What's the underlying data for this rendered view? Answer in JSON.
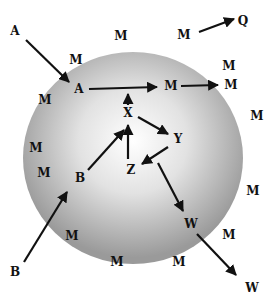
{
  "diagram": {
    "type": "sphere-particle-transfer",
    "colors": {
      "sphere_center": "#ffffff",
      "sphere_edge": "#9a9a9a",
      "ink": "#111111",
      "background": "#ffffff"
    },
    "sphere": {
      "cx": 133,
      "cy": 158,
      "rx": 110,
      "ry": 106
    },
    "labels": [
      {
        "id": "A-outside",
        "text": "A",
        "x": 15,
        "y": 31
      },
      {
        "id": "M-top-1",
        "text": "M",
        "x": 121,
        "y": 36
      },
      {
        "id": "M-top-2",
        "text": "M",
        "x": 184,
        "y": 35
      },
      {
        "id": "Q-outside",
        "text": "Q",
        "x": 243,
        "y": 21
      },
      {
        "id": "M-upper-left",
        "text": "M",
        "x": 76,
        "y": 60
      },
      {
        "id": "A-surface",
        "text": "A",
        "x": 79,
        "y": 89
      },
      {
        "id": "M-inner",
        "text": "M",
        "x": 171,
        "y": 86
      },
      {
        "id": "M-upper-right-1",
        "text": "M",
        "x": 229,
        "y": 66
      },
      {
        "id": "M-upper-right-2",
        "text": "M",
        "x": 231,
        "y": 85
      },
      {
        "id": "M-left-1",
        "text": "M",
        "x": 45,
        "y": 100
      },
      {
        "id": "X",
        "text": "X",
        "x": 128,
        "y": 113
      },
      {
        "id": "M-right-1",
        "text": "M",
        "x": 257,
        "y": 116
      },
      {
        "id": "Y",
        "text": "Y",
        "x": 178,
        "y": 139
      },
      {
        "id": "M-left-2",
        "text": "M",
        "x": 36,
        "y": 148
      },
      {
        "id": "Z",
        "text": "Z",
        "x": 131,
        "y": 170
      },
      {
        "id": "M-left-3",
        "text": "M",
        "x": 44,
        "y": 173
      },
      {
        "id": "B-surface",
        "text": "B",
        "x": 80,
        "y": 178
      },
      {
        "id": "M-right-2",
        "text": "M",
        "x": 253,
        "y": 191
      },
      {
        "id": "M-lower-left",
        "text": "M",
        "x": 72,
        "y": 236
      },
      {
        "id": "W-surface",
        "text": "W",
        "x": 191,
        "y": 224
      },
      {
        "id": "M-lower-right",
        "text": "M",
        "x": 229,
        "y": 235
      },
      {
        "id": "M-bottom-1",
        "text": "M",
        "x": 117,
        "y": 262
      },
      {
        "id": "M-bottom-2",
        "text": "M",
        "x": 179,
        "y": 262
      },
      {
        "id": "B-outside",
        "text": "B",
        "x": 15,
        "y": 272
      },
      {
        "id": "W-outside",
        "text": "W",
        "x": 252,
        "y": 288
      }
    ],
    "arrows": [
      {
        "from": "A-outside",
        "to": "A-surface"
      },
      {
        "from": "A-surface",
        "to": "M-inner"
      },
      {
        "from": "M-inner",
        "to": "M-upper-right-2"
      },
      {
        "from": "M-top-2",
        "to": "Q-outside"
      },
      {
        "from": "X",
        "to": "A-M line"
      },
      {
        "from": "Z",
        "to": "X"
      },
      {
        "from": "X",
        "to": "Y"
      },
      {
        "from": "Y",
        "to": "Z"
      },
      {
        "from": "B-surface",
        "to": "X"
      },
      {
        "from": "B-outside",
        "to": "B-surface"
      },
      {
        "from": "Z",
        "to": "W-surface"
      },
      {
        "from": "W-surface",
        "to": "W-outside"
      }
    ]
  }
}
